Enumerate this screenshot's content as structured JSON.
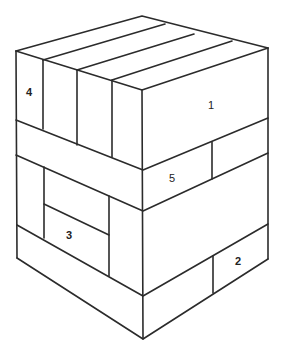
{
  "diagram": {
    "title": "",
    "colors": {
      "stroke": "#2b2b2b",
      "fill": "#ffffff",
      "text": "#222222"
    },
    "labels": [
      {
        "id": "piece-1",
        "text": "1",
        "x": 211,
        "y": 106,
        "bold": false
      },
      {
        "id": "piece-2",
        "text": "2",
        "x": 238,
        "y": 262,
        "bold": true
      },
      {
        "id": "piece-3",
        "text": "3",
        "x": 69,
        "y": 236,
        "bold": true
      },
      {
        "id": "piece-4",
        "text": "4",
        "x": 29,
        "y": 93,
        "bold": true
      },
      {
        "id": "piece-5",
        "text": "5",
        "x": 172,
        "y": 179,
        "bold": false
      }
    ]
  }
}
